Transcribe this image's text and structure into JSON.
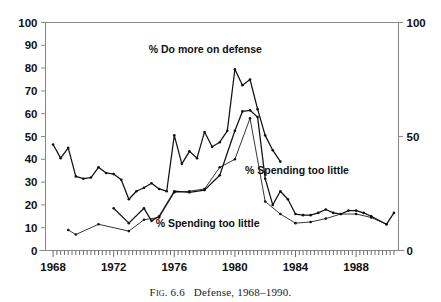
{
  "caption": {
    "fig_label": "Fig. 6.6",
    "text": "Defense, 1968–1990.",
    "gap": "   "
  },
  "annotations": [
    {
      "id": "do-more",
      "text": "% Do more on defense",
      "x": 1978.05,
      "y": 86.5
    },
    {
      "id": "spending-right",
      "text": "% Spending too little",
      "x": 1984.1,
      "y": 33.5
    },
    {
      "id": "spending-bottom",
      "text": "% Spending too little",
      "x": 1978.2,
      "y": 10.5
    }
  ],
  "axes": {
    "left_ticks": [
      "0",
      "10",
      "20",
      "30",
      "40",
      "50",
      "60",
      "70",
      "80",
      "90",
      "100"
    ],
    "right_ticks": [
      "0",
      "50",
      "100"
    ],
    "x_ticks": [
      "1968",
      "1972",
      "1976",
      "1980",
      "1984",
      "1988"
    ]
  },
  "chart_data": {
    "type": "line",
    "title": "Defense, 1968–1990.",
    "xlabel": "",
    "ylabel": "",
    "xlim": [
      1967.5,
      1990.8
    ],
    "ylim": [
      0,
      100
    ],
    "y_left_axis": {
      "min": 0,
      "max": 100,
      "major_step": 10,
      "ticks": [
        0,
        10,
        20,
        30,
        40,
        50,
        60,
        70,
        80,
        90,
        100
      ]
    },
    "y_right_axis": {
      "min": 0,
      "max": 100,
      "ticks": [
        0,
        50,
        100
      ]
    },
    "x_axis": {
      "min": 1967.5,
      "max": 1990.8,
      "major_ticks": [
        1968,
        1972,
        1976,
        1980,
        1984,
        1988
      ],
      "minor_tick_step": 0.25
    },
    "grid": false,
    "legend": "annotated-inline",
    "markers": "filled-dots",
    "series": [
      {
        "name": "% Do more on defense",
        "label": "% Do more on defense",
        "color": "#111111",
        "x": [
          1968.0,
          1968.5,
          1969.0,
          1969.5,
          1970.0,
          1970.5,
          1971.0,
          1971.5,
          1972.0,
          1972.5,
          1973.0,
          1973.5,
          1974.0,
          1974.5,
          1975.0,
          1975.5,
          1976.0,
          1976.5,
          1977.0,
          1977.5,
          1978.0,
          1978.5,
          1979.0,
          1979.5,
          1980.0,
          1980.5,
          1981.0,
          1981.5,
          1982.0,
          1982.5,
          1983.0
        ],
        "y": [
          46.5,
          40.5,
          45.0,
          32.5,
          31.5,
          32.0,
          36.5,
          34.0,
          33.5,
          31.0,
          22.5,
          26.0,
          27.5,
          29.5,
          27.0,
          26.0,
          50.5,
          38.0,
          43.5,
          40.5,
          52.0,
          45.5,
          47.5,
          52.5,
          79.5,
          72.5,
          75.0,
          62.0,
          50.5,
          44.0,
          39.0
        ],
        "values_note": "percent who say do more on defense"
      },
      {
        "name": "% Spending too little (series A)",
        "label": "% Spending too little",
        "color": "#111111",
        "x": [
          1972.0,
          1973.0,
          1974.0,
          1974.5,
          1975.0,
          1976.0,
          1977.0,
          1978.0,
          1979.0,
          1980.0,
          1980.5,
          1981.0,
          1981.5,
          1982.0,
          1982.5,
          1983.0,
          1983.5,
          1984.0,
          1984.5,
          1985.0,
          1985.5,
          1986.0,
          1986.5,
          1987.0,
          1987.5,
          1988.0,
          1988.5,
          1989.0,
          1990.0,
          1990.5
        ],
        "y": [
          18.5,
          12.0,
          18.5,
          13.0,
          15.0,
          26.0,
          25.5,
          26.5,
          33.0,
          52.5,
          61.0,
          61.5,
          58.5,
          31.5,
          20.0,
          26.0,
          22.5,
          16.0,
          15.5,
          15.5,
          16.5,
          18.0,
          16.5,
          16.0,
          17.5,
          17.5,
          16.5,
          15.0,
          11.5,
          16.5
        ]
      },
      {
        "name": "% Spending too little (series B)",
        "label": "% Spending too little",
        "color": "#111111",
        "x": [
          1969.0,
          1969.5,
          1971.0,
          1973.0,
          1974.0,
          1975.0,
          1976.0,
          1977.0,
          1978.0,
          1979.0,
          1980.0,
          1981.0,
          1982.0,
          1983.0,
          1984.0,
          1985.0,
          1986.0,
          1987.0,
          1988.0,
          1989.0,
          1990.0
        ],
        "y": [
          9.0,
          7.0,
          11.5,
          8.5,
          13.5,
          14.5,
          25.5,
          26.0,
          27.0,
          36.5,
          40.0,
          58.0,
          21.5,
          16.0,
          12.0,
          12.5,
          14.0,
          16.0,
          16.0,
          14.5,
          11.5
        ]
      }
    ]
  }
}
